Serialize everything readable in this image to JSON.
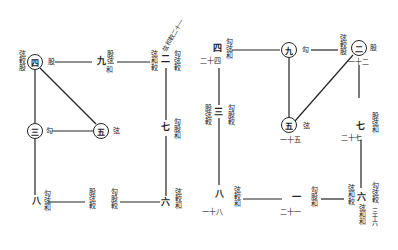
{
  "left_diagram": {
    "nodes": {
      "n4": "四",
      "n3": "三",
      "n5": "五"
    },
    "labels": {
      "n4_left": "弦較股",
      "n4_right": "股",
      "n9_num": "九",
      "n9_top": "股弦",
      "n9_bottom": "和",
      "n2_num": "二",
      "n2_left": "弦和較",
      "n2_right": "勾弦較",
      "n2_diag": "弦和較二十一",
      "n7_num": "七",
      "n7_right": "勾股和",
      "n3_right": "勾",
      "n5_right": "弦",
      "n8_num": "八",
      "n8_text": "勾弦和",
      "n1_left": "股弦較",
      "n1_right": "勾股較",
      "n6_num": "六",
      "n6_right": "弦較和"
    }
  },
  "right_diagram": {
    "nodes": {
      "n9": "九",
      "n2": "二",
      "n5": "五"
    },
    "labels": {
      "n4_num": "四",
      "n4_sub": "二十四",
      "n4_right": "勾弦和",
      "n9_right": "勾",
      "n2_left": "弦較股",
      "n2_right": "股",
      "n2_sub": "一十二",
      "n3_num": "三",
      "n3_left": "股弦較",
      "n3_right": "勾股較",
      "n5_right": "弦",
      "n5_sub": "一十五",
      "n7_num": "七",
      "n7_right": "股弦和",
      "n7_sub": "二十七",
      "n8_num": "八",
      "n8_right": "弦較和",
      "n8_sub": "一十八",
      "n1_num": "一",
      "n1_right": "勾股和",
      "n1_sub": "二十一",
      "n6_num": "六",
      "n6_left": "弦和較",
      "n6_right": "勾弦較",
      "n6_below": "弦和和",
      "n6_sub": "三十六"
    }
  }
}
